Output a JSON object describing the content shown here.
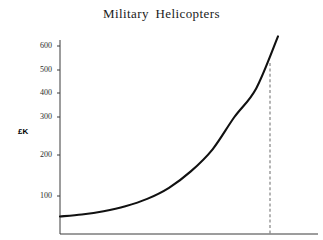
{
  "chart_data": {
    "type": "line",
    "title": "Military  Helicopters",
    "xlabel": "",
    "ylabel": "£K",
    "ylim": [
      0,
      650
    ],
    "grid": false,
    "legend": null,
    "y_ticks": [
      {
        "label": "600",
        "value": 600,
        "y_px": 46
      },
      {
        "label": "500",
        "value": 500,
        "y_px": 70
      },
      {
        "label": "400",
        "value": 400,
        "y_px": 93
      },
      {
        "label": "300",
        "value": 300,
        "y_px": 117
      },
      {
        "label": "200",
        "value": 200,
        "y_px": 155
      },
      {
        "label": "100",
        "value": 100,
        "y_px": 196
      }
    ],
    "x_ticks": [],
    "series": [
      {
        "name": "Cost",
        "x": [
          0,
          10,
          20,
          30,
          40,
          50,
          60,
          70,
          80,
          90,
          100
        ],
        "values": [
          50,
          55,
          63,
          75,
          93,
          120,
          160,
          215,
          300,
          420,
          640
        ]
      }
    ],
    "annotations": [
      {
        "type": "dashed-vline",
        "label": "",
        "x_px": 270,
        "y_top_px": 63,
        "y_bottom_px": 234,
        "value": 520
      }
    ],
    "axes": {
      "x_axis_y_px": 234,
      "y_axis_x_px": 60,
      "y_axis_top_px": 40,
      "x_axis_right_px": 318
    },
    "colors": {
      "curve": "#111111",
      "axis": "#3a3a3a",
      "dashed": "#777777",
      "text": "#1a1a1a",
      "background": "#ffffff"
    }
  }
}
